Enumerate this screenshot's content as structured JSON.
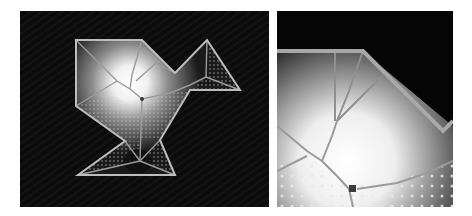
{
  "figure": {
    "panels": [
      {
        "id": "overview",
        "description": "Polygon outline with medial-axis skeleton and distance-field shading",
        "background": "#0b0b0b",
        "outline_color": "#bdbdbd"
      },
      {
        "id": "zoomed-detail",
        "description": "Magnified view of the upper skeleton junction region",
        "background": "#0b0b0b",
        "outline_color": "#a8a8a8"
      }
    ],
    "colors": {
      "background": "#0b0b0b",
      "outline": "#bdbdbd",
      "glow": "#ffffff",
      "skeleton": "#8a8a8a",
      "junction": "#3a3a3a",
      "dots": "#dcdcdc"
    }
  }
}
